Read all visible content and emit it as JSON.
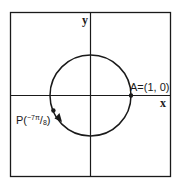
{
  "diagram": {
    "type": "unit-circle",
    "axes": {
      "x_label": "x",
      "y_label": "y"
    },
    "points": {
      "A": {
        "label": "A=(1, 0)"
      },
      "P": {
        "prefix": "P(",
        "sign": "−",
        "numerator": "7π",
        "slash": "/",
        "denominator": "8",
        "suffix": ")"
      }
    },
    "colors": {
      "stroke": "#1a1a1a",
      "background": "#ffffff"
    }
  }
}
